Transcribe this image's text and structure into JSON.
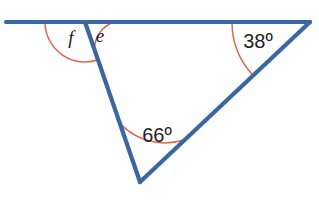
{
  "figure": {
    "background_color": "#ffffff",
    "line_color": "#3a67a2",
    "arc_color": "#d9674e",
    "label_color": "#231f20"
  },
  "labels": {
    "angle_f": "f",
    "angle_e": "e",
    "angle_right": "38",
    "angle_right_degree": "°",
    "angle_right_full": "38º",
    "angle_bottom": "66",
    "angle_bottom_degree": "°",
    "angle_bottom_full": "66º"
  },
  "geometry": {
    "horizontal_line": {
      "x1": 6,
      "y1": 22,
      "x2": 310,
      "y2": 22
    },
    "transversal": {
      "x1": 85,
      "y1": 22,
      "x2": 140,
      "y2": 182
    },
    "hypotenuse": {
      "x1": 310,
      "y1": 22,
      "x2": 140,
      "y2": 182
    },
    "vertex_top": {
      "x": 85,
      "y": 22,
      "name": "T"
    },
    "vertex_right": {
      "x": 310,
      "y": 22,
      "name": "R"
    },
    "vertex_bottom": {
      "x": 140,
      "y": 182,
      "name": "B"
    },
    "arc_f_radius": 40,
    "arc_e_radius": 29,
    "arc_38_radius": 78,
    "arc_66_radius": 62
  },
  "chart_data": {
    "type": "diagram",
    "subtype": "euclidean-angle-figure",
    "known_angles": [
      {
        "label": "38º",
        "value": 38,
        "vertex": "right",
        "position": {
          "x": 258,
          "y": 42
        }
      },
      {
        "label": "66º",
        "value": 66,
        "vertex": "bottom",
        "position": {
          "x": 156,
          "y": 136
        }
      }
    ],
    "unknown_angles": [
      {
        "label": "f",
        "vertex": "top",
        "position": {
          "x": 71,
          "y": 39
        }
      },
      {
        "label": "e",
        "vertex": "top",
        "position": {
          "x": 99,
          "y": 38
        }
      }
    ],
    "segments": [
      {
        "name": "horizontal-line",
        "from": [
          6,
          22
        ],
        "to": [
          310,
          22
        ]
      },
      {
        "name": "transversal",
        "from": [
          85,
          22
        ],
        "to": [
          140,
          182
        ]
      },
      {
        "name": "hypotenuse",
        "from": [
          310,
          22
        ],
        "to": [
          140,
          182
        ]
      }
    ],
    "grid": false,
    "legend": null
  }
}
